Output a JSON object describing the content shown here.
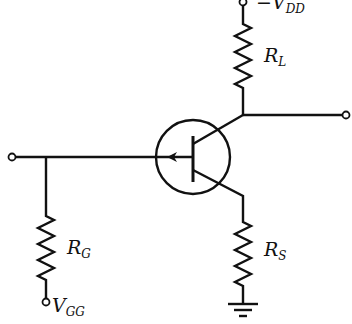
{
  "diagram": {
    "type": "circuit-schematic",
    "title": "",
    "components": [
      {
        "id": "Q1",
        "kind": "pnp-transistor-symbol",
        "description": "transistor in circle with arrow on base lead"
      },
      {
        "id": "RL",
        "kind": "resistor",
        "label": {
          "main": "R",
          "sub": "L"
        }
      },
      {
        "id": "RS",
        "kind": "resistor",
        "label": {
          "main": "R",
          "sub": "S"
        }
      },
      {
        "id": "RG",
        "kind": "resistor",
        "label": {
          "main": "R",
          "sub": "G"
        }
      },
      {
        "id": "GND",
        "kind": "ground"
      }
    ],
    "terminals": {
      "vdd": {
        "prefix": "−",
        "main": "V",
        "sub": "DD"
      },
      "vgg": {
        "main": "V",
        "sub": "GG"
      },
      "input": {
        "label": ""
      },
      "output": {
        "label": ""
      }
    }
  }
}
